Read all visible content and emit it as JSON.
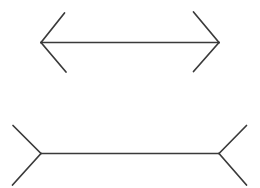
{
  "figure": {
    "canvas": {
      "width": 260,
      "height": 188
    },
    "background_color": "#ffffff",
    "stroke_color": "#3a3a3a",
    "stroke_width": 1.7,
    "shapes": [
      {
        "name": "arrows-out-figure",
        "label": "Upper figure: double-headed arrow with outward arrowheads",
        "shaft": {
          "x1": 41,
          "y1": 42.5,
          "x2": 219,
          "y2": 42.5
        },
        "fins": [
          {
            "name": "left-upper-fin",
            "x1": 41,
            "y1": 42.5,
            "x2": 64.5,
            "y2": 13
          },
          {
            "name": "left-lower-fin",
            "x1": 41,
            "y1": 42.5,
            "x2": 66,
            "y2": 72
          },
          {
            "name": "right-upper-fin",
            "x1": 219,
            "y1": 42.5,
            "x2": 193.5,
            "y2": 12
          },
          {
            "name": "right-lower-fin",
            "x1": 219,
            "y1": 42.5,
            "x2": 193.5,
            "y2": 71.5
          }
        ]
      },
      {
        "name": "fins-in-figure",
        "label": "Lower figure: line with inward-pointing fins",
        "shaft": {
          "x1": 41,
          "y1": 153.5,
          "x2": 219,
          "y2": 153.5
        },
        "fins": [
          {
            "name": "left-upper-fin",
            "x1": 41,
            "y1": 153.5,
            "x2": 13,
            "y2": 125.5
          },
          {
            "name": "left-lower-fin",
            "x1": 41,
            "y1": 153.5,
            "x2": 12.5,
            "y2": 185
          },
          {
            "name": "right-upper-fin",
            "x1": 219,
            "y1": 153.5,
            "x2": 246.5,
            "y2": 125.5
          },
          {
            "name": "right-lower-fin",
            "x1": 219,
            "y1": 153.5,
            "x2": 246.5,
            "y2": 185
          }
        ]
      }
    ]
  }
}
